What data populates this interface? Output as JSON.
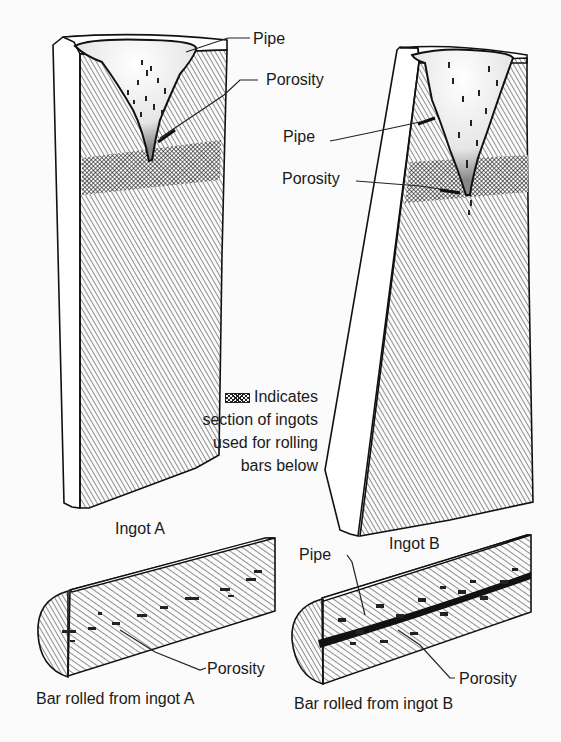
{
  "figure": {
    "ingots": [
      {
        "id": "A",
        "caption": "Ingot A",
        "callouts": [
          {
            "label": "Pipe"
          },
          {
            "label": "Porosity"
          }
        ]
      },
      {
        "id": "B",
        "caption": "Ingot B",
        "callouts": [
          {
            "label": "Pipe"
          },
          {
            "label": "Porosity"
          }
        ]
      }
    ],
    "legend": {
      "line1": "Indicates",
      "line2": "section of ingots",
      "line3": "used for rolling",
      "line4": "bars below",
      "swatch": "crosshatch-swatch"
    },
    "bars": [
      {
        "id": "A",
        "caption": "Bar rolled from ingot A",
        "callouts": [
          {
            "label": "Porosity"
          }
        ]
      },
      {
        "id": "B",
        "caption": "Bar rolled from ingot B",
        "callouts": [
          {
            "label": "Pipe"
          },
          {
            "label": "Porosity"
          }
        ]
      }
    ]
  }
}
